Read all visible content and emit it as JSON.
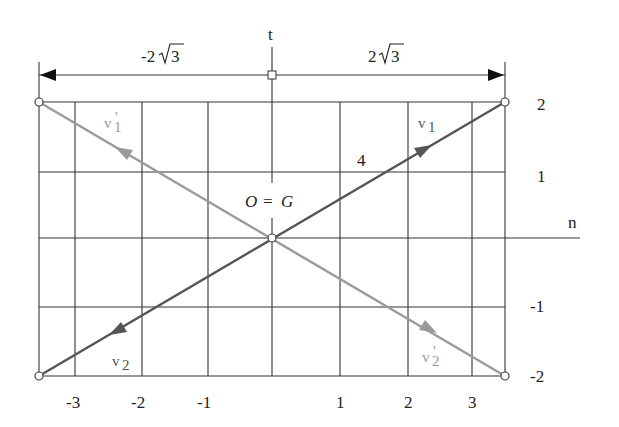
{
  "diagram": {
    "axes": {
      "horizontal_label": "n",
      "vertical_label": "t"
    },
    "dimensions": {
      "left_label_prefix": "-2",
      "left_label_radicand": "3",
      "right_label_prefix": "2",
      "right_label_radicand": "3"
    },
    "origin_label": {
      "left": "O",
      "equals": "=",
      "right": "G"
    },
    "segment_length_label": "4",
    "vectors": {
      "v1": {
        "label": "v",
        "subscript": "1",
        "prime": "",
        "color": "#555555"
      },
      "v1_prime": {
        "label": "v",
        "subscript": "1",
        "prime": "'",
        "color": "#9a9a9a"
      },
      "v2": {
        "label": "v",
        "subscript": "2",
        "prime": "",
        "color": "#555555"
      },
      "v2_prime": {
        "label": "v",
        "subscript": "2",
        "prime": "'",
        "color": "#9a9a9a"
      }
    },
    "x_ticks": [
      "-3",
      "-2",
      "-1",
      "1",
      "2",
      "3"
    ],
    "y_ticks": [
      "2",
      "1",
      "-1",
      "-2"
    ],
    "colors": {
      "grid": "#333333",
      "dark_vector": "#555555",
      "light_vector": "#9a9a9a",
      "text": "#222222"
    }
  }
}
